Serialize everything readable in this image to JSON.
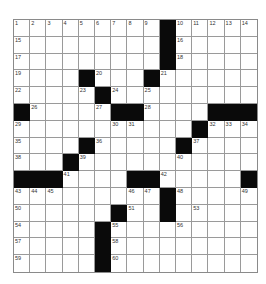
{
  "puzzle": {
    "rows": 15,
    "cols": 15,
    "colors": {
      "black": "#0a0a0a",
      "white": "#ffffff",
      "grid_line": "#9a9a9a"
    },
    "layout": [
      ".........#.....",
      ".........#.....",
      ".........#.....",
      "....#...#......",
      ".....#.........",
      "#.....##....###",
      "...........#...",
      "....#.....#....",
      "...#...........",
      "###....##.....#",
      ".........#.....",
      "......#..#.....",
      ".....#.........",
      ".....#.........",
      ".....#........."
    ],
    "numbers": [
      {
        "r": 0,
        "c": 0,
        "n": "1"
      },
      {
        "r": 0,
        "c": 1,
        "n": "2"
      },
      {
        "r": 0,
        "c": 2,
        "n": "3"
      },
      {
        "r": 0,
        "c": 3,
        "n": "4"
      },
      {
        "r": 0,
        "c": 4,
        "n": "5"
      },
      {
        "r": 0,
        "c": 5,
        "n": "6"
      },
      {
        "r": 0,
        "c": 6,
        "n": "7"
      },
      {
        "r": 0,
        "c": 7,
        "n": "8"
      },
      {
        "r": 0,
        "c": 8,
        "n": "9"
      },
      {
        "r": 0,
        "c": 10,
        "n": "10"
      },
      {
        "r": 0,
        "c": 11,
        "n": "11"
      },
      {
        "r": 0,
        "c": 12,
        "n": "12"
      },
      {
        "r": 0,
        "c": 13,
        "n": "13"
      },
      {
        "r": 0,
        "c": 14,
        "n": "14"
      },
      {
        "r": 1,
        "c": 0,
        "n": "15"
      },
      {
        "r": 1,
        "c": 10,
        "n": "16"
      },
      {
        "r": 2,
        "c": 0,
        "n": "17"
      },
      {
        "r": 2,
        "c": 10,
        "n": "18"
      },
      {
        "r": 3,
        "c": 0,
        "n": "19"
      },
      {
        "r": 3,
        "c": 5,
        "n": "20"
      },
      {
        "r": 3,
        "c": 9,
        "n": "21"
      },
      {
        "r": 4,
        "c": 0,
        "n": "22"
      },
      {
        "r": 4,
        "c": 4,
        "n": "23"
      },
      {
        "r": 4,
        "c": 6,
        "n": "24"
      },
      {
        "r": 4,
        "c": 8,
        "n": "25"
      },
      {
        "r": 5,
        "c": 1,
        "n": "26"
      },
      {
        "r": 5,
        "c": 5,
        "n": "27"
      },
      {
        "r": 5,
        "c": 8,
        "n": "28"
      },
      {
        "r": 6,
        "c": 0,
        "n": "29"
      },
      {
        "r": 6,
        "c": 6,
        "n": "30"
      },
      {
        "r": 6,
        "c": 7,
        "n": "31"
      },
      {
        "r": 6,
        "c": 12,
        "n": "32"
      },
      {
        "r": 6,
        "c": 13,
        "n": "33"
      },
      {
        "r": 6,
        "c": 14,
        "n": "34"
      },
      {
        "r": 7,
        "c": 0,
        "n": "35"
      },
      {
        "r": 7,
        "c": 5,
        "n": "36"
      },
      {
        "r": 7,
        "c": 11,
        "n": "37"
      },
      {
        "r": 8,
        "c": 0,
        "n": "38"
      },
      {
        "r": 8,
        "c": 4,
        "n": "39"
      },
      {
        "r": 8,
        "c": 10,
        "n": "40"
      },
      {
        "r": 9,
        "c": 3,
        "n": "41"
      },
      {
        "r": 9,
        "c": 9,
        "n": "42"
      },
      {
        "r": 10,
        "c": 0,
        "n": "43"
      },
      {
        "r": 10,
        "c": 1,
        "n": "44"
      },
      {
        "r": 10,
        "c": 2,
        "n": "45"
      },
      {
        "r": 10,
        "c": 7,
        "n": "46"
      },
      {
        "r": 10,
        "c": 8,
        "n": "47"
      },
      {
        "r": 10,
        "c": 10,
        "n": "48"
      },
      {
        "r": 10,
        "c": 14,
        "n": "49"
      },
      {
        "r": 11,
        "c": 0,
        "n": "50"
      },
      {
        "r": 11,
        "c": 7,
        "n": "51"
      },
      {
        "r": 11,
        "c": 9,
        "n": "52"
      },
      {
        "r": 11,
        "c": 11,
        "n": "53"
      },
      {
        "r": 12,
        "c": 0,
        "n": "54"
      },
      {
        "r": 12,
        "c": 6,
        "n": "55"
      },
      {
        "r": 12,
        "c": 10,
        "n": "56"
      },
      {
        "r": 13,
        "c": 0,
        "n": "57"
      },
      {
        "r": 13,
        "c": 6,
        "n": "58"
      },
      {
        "r": 14,
        "c": 0,
        "n": "59"
      },
      {
        "r": 14,
        "c": 6,
        "n": "60"
      }
    ]
  }
}
